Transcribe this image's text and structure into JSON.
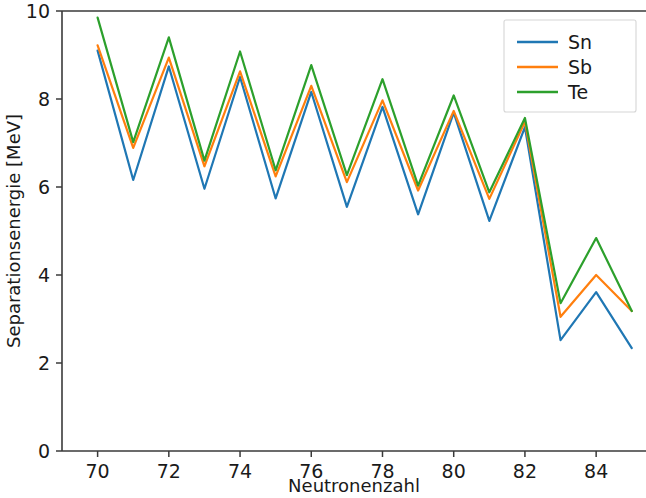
{
  "chart_data": {
    "type": "line",
    "title": "",
    "xlabel": "Neutronenzahl",
    "ylabel": "Separationsenergie [MeV]",
    "xlim": [
      69,
      85.4
    ],
    "ylim": [
      0,
      10
    ],
    "xticks": [
      70,
      72,
      74,
      76,
      78,
      80,
      82,
      84
    ],
    "xtick_labels": [
      "70",
      "72",
      "74",
      "76",
      "78",
      "80",
      "82",
      "84"
    ],
    "yticks": [
      0,
      2,
      4,
      6,
      8,
      10
    ],
    "ytick_labels": [
      "0",
      "2",
      "4",
      "6",
      "8",
      "10"
    ],
    "grid": false,
    "legend_position": "upper right",
    "x": [
      70,
      71,
      72,
      73,
      74,
      75,
      76,
      77,
      78,
      79,
      80,
      81,
      82,
      83,
      84,
      85
    ],
    "series": [
      {
        "name": "Sn",
        "color": "#1f77b4",
        "values": [
          9.1,
          6.16,
          8.74,
          5.96,
          8.5,
          5.74,
          8.16,
          5.55,
          7.82,
          5.38,
          7.69,
          5.23,
          7.36,
          2.52,
          3.61,
          2.34
        ]
      },
      {
        "name": "Sb",
        "color": "#ff7f0e",
        "values": [
          9.22,
          6.89,
          8.94,
          6.47,
          8.63,
          6.24,
          8.3,
          6.11,
          7.97,
          5.92,
          7.73,
          5.73,
          7.48,
          3.05,
          4.0,
          3.18
        ]
      },
      {
        "name": "Te",
        "color": "#2ca02c",
        "values": [
          9.85,
          7.02,
          9.4,
          6.6,
          9.08,
          6.38,
          8.77,
          6.27,
          8.45,
          6.03,
          8.08,
          5.88,
          7.57,
          3.36,
          4.84,
          3.18
        ]
      }
    ]
  },
  "legend": {
    "entries": [
      {
        "label": "Sn"
      },
      {
        "label": "Sb"
      },
      {
        "label": "Te"
      }
    ]
  },
  "axes": {
    "x_title": "Neutronenzahl",
    "y_title": "Separationsenergie [MeV]"
  },
  "colors": {
    "sn": "#5a9fd4",
    "sb": "#f0a04b",
    "te": "#6cb56c",
    "axis": "#3a3a3a",
    "text": "#1a1a1a",
    "background": "#ffffff"
  }
}
